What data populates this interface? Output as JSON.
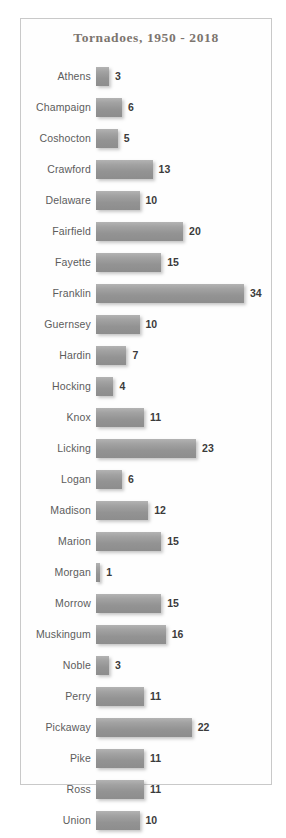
{
  "chart_data": {
    "type": "bar",
    "orientation": "horizontal",
    "title": "Tornadoes, 1950 - 2018",
    "xlabel": "",
    "ylabel": "",
    "grid": false,
    "legend": null,
    "xlim": [
      0,
      34
    ],
    "categories": [
      "Athens",
      "Champaign",
      "Coshocton",
      "Crawford",
      "Delaware",
      "Fairfield",
      "Fayette",
      "Franklin",
      "Guernsey",
      "Hardin",
      "Hocking",
      "Knox",
      "Licking",
      "Logan",
      "Madison",
      "Marion",
      "Morgan",
      "Morrow",
      "Muskingum",
      "Noble",
      "Perry",
      "Pickaway",
      "Pike",
      "Ross",
      "Union"
    ],
    "values": [
      3,
      6,
      5,
      13,
      10,
      20,
      15,
      34,
      10,
      7,
      4,
      11,
      23,
      6,
      12,
      15,
      1,
      15,
      16,
      3,
      11,
      22,
      11,
      11,
      10
    ],
    "data_labels": [
      "3",
      "6",
      "5",
      "13",
      "10",
      "20",
      "15",
      "34",
      "10",
      "7",
      "4",
      "11",
      "23",
      "6",
      "12",
      "15",
      "1",
      "15",
      "16",
      "3",
      "11",
      "22",
      "11",
      "11",
      "10"
    ]
  },
  "colors": {
    "bar_fill": "#9a9a9a",
    "title_text": "#7c756f",
    "category_text": "#5c5c5c",
    "value_text": "#3b3b3b",
    "frame_border": "#c9c9c9",
    "background": "#ffffff"
  }
}
